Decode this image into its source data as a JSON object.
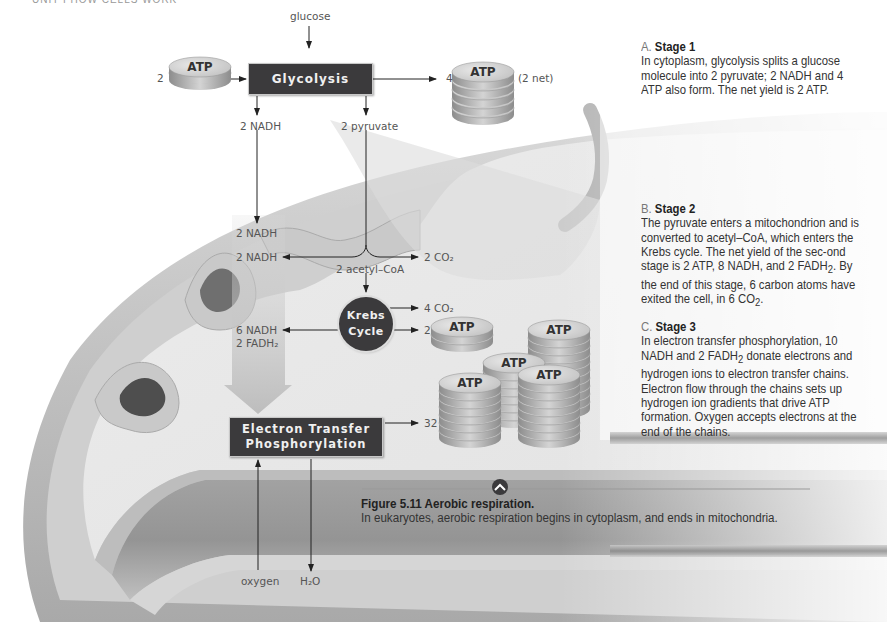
{
  "running_head": "UNIT I   HOW CELLS WORK",
  "diagram": {
    "inputs": {
      "glucose": "glucose",
      "atp_in_count": "2",
      "atp_label": "ATP",
      "oxygen": "oxygen",
      "water": "H₂O"
    },
    "glycolysis": {
      "label": "Glycolysis",
      "atp_out_count": "4",
      "atp_net": "(2 net)",
      "nadh_out": "2 NADH",
      "pyruvate_out": "2 pyruvate"
    },
    "stage2": {
      "nadh_from_glycolysis": "2 NADH",
      "nadh_from_pyruvate": "2 NADH",
      "co2_from_pyruvate": "2 CO₂",
      "acetyl_coa": "2 acetyl–CoA",
      "krebs_line1": "Krebs",
      "krebs_line2": "Cycle",
      "krebs_co2": "4 CO₂",
      "krebs_atp_count": "2",
      "krebs_nadh": "6 NADH",
      "krebs_fadh2": "2 FADH₂"
    },
    "etp": {
      "line1": "Electron Transfer",
      "line2": "Phosphorylation",
      "atp_out_count": "32"
    },
    "atp_stack_labels": [
      "ATP",
      "ATP",
      "ATP",
      "ATP",
      "ATP",
      "ATP",
      "ATP"
    ]
  },
  "sidebar": {
    "stage1": {
      "letter": "A.",
      "title": "Stage 1",
      "body": "In cytoplasm, glycolysis splits a glucose molecule into 2 pyruvate; 2 NADH and 4 ATP also form. The net yield is 2 ATP."
    },
    "stage2": {
      "letter": "B.",
      "title": "Stage 2",
      "body_part1": "The pyruvate enters a mitochondrion and is converted to acetyl–CoA, which enters the Krebs cycle. The net yield of the sec-ond stage is 2 ATP, 8 NADH, and 2 FADH",
      "sub1": "2",
      "body_part2": ". By the end of this stage, 6 carbon atoms have exited the cell, in 6 CO",
      "sub2": "2",
      "body_part3": "."
    },
    "stage3": {
      "letter": "C.",
      "title": "Stage 3",
      "body_part1": "In electron transfer phosphorylation, 10 NADH and 2 FADH",
      "sub1": "2",
      "body_part2": " donate electrons and hydrogen ions to electron transfer chains. Electron flow through the chains sets up hydrogen ion gradients that drive ATP formation. Oxygen accepts electrons at the end of the chains."
    }
  },
  "caption": {
    "title": "Figure 5.11  Aerobic respiration.",
    "body": "In eukaryotes, aerobic respiration begins in cytoplasm, and ends in mitochondria."
  }
}
